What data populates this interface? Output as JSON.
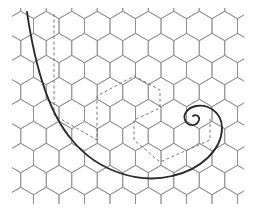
{
  "figure": {
    "description": "Hexagonal lattice with a spiral curve and a dashed zig-zag path",
    "colors": {
      "background": "#ffffff",
      "grid": "#8a8a8a",
      "spiral": "#2a2a2a",
      "dashed_path": "#6a6a6a"
    },
    "grid": {
      "orientation": "pointy-top",
      "origin_x": 8,
      "origin_y": 4,
      "col_spacing": 25.5,
      "row_spacing": 22,
      "radius": 14.7,
      "rows": 10,
      "cols": 10
    },
    "spiral_path": "M 27 12 C 34 60, 46 110, 72 140 C 98 172, 140 184, 172 176 C 200 170, 222 150, 222 128 C 222 112, 208 104, 196 106 C 186 108, 182 116, 186 122 C 190 127, 197 126, 199 120 C 200 116, 196 114, 193 116",
    "dashed_path": "M 54 14 L 54 115 L 97 140 L 97 96 L 134 76 L 160 90 L 160 108 L 134 120 L 134 140 L 160 162 L 210 140 L 210 116"
  }
}
